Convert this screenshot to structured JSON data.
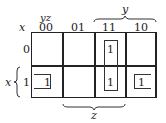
{
  "kmap": {
    "row_var": "x",
    "col_vars": "yz",
    "col_headers": [
      "00",
      "01",
      "11",
      "10"
    ],
    "row_headers": [
      "0",
      "1"
    ],
    "cells": [
      [
        "",
        "",
        "1",
        ""
      ],
      [
        "1",
        "",
        "1",
        "1"
      ]
    ],
    "brace_labels": {
      "y": "y",
      "z": "z",
      "x": "x"
    },
    "groups": [
      {
        "name": "column-11-pair",
        "cells": [
          [
            0,
            2
          ],
          [
            1,
            2
          ]
        ]
      },
      {
        "name": "wraparound-pair",
        "cells": [
          [
            1,
            0
          ],
          [
            1,
            3
          ]
        ]
      }
    ]
  }
}
